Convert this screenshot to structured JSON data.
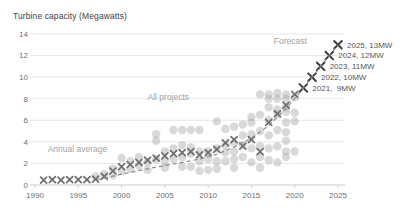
{
  "chart_data": {
    "type": "scatter",
    "title": "Turbine capacity (Megawatts)",
    "xlabel": "",
    "ylabel": "Turbine capacity (Megawatts)",
    "xlim": [
      1990,
      2026
    ],
    "ylim": [
      0,
      14
    ],
    "x_ticks": [
      1990,
      1995,
      2000,
      2005,
      2010,
      2015,
      2020,
      2025
    ],
    "y_ticks": [
      0,
      2,
      4,
      6,
      8,
      10,
      12,
      14
    ],
    "grid": "horizontal",
    "legend_position": "inline-labels",
    "series": [
      {
        "name": "All projects",
        "type": "circles",
        "points": [
          [
            1997,
            0.8
          ],
          [
            1998,
            1.0
          ],
          [
            1999,
            1.5
          ],
          [
            1999,
            0.9
          ],
          [
            2000,
            2.5
          ],
          [
            2000,
            1.3
          ],
          [
            2001,
            2.2
          ],
          [
            2001,
            1.5
          ],
          [
            2002,
            2.6
          ],
          [
            2002,
            1.8
          ],
          [
            2003,
            2.1
          ],
          [
            2003,
            1.4
          ],
          [
            2004,
            4.7
          ],
          [
            2004,
            4.1
          ],
          [
            2004,
            2.4
          ],
          [
            2005,
            3.1
          ],
          [
            2005,
            2.2
          ],
          [
            2005,
            1.6
          ],
          [
            2006,
            5.1
          ],
          [
            2006,
            3.4
          ],
          [
            2006,
            2.4
          ],
          [
            2007,
            5.1
          ],
          [
            2007,
            3.7
          ],
          [
            2007,
            2.6
          ],
          [
            2007,
            1.7
          ],
          [
            2008,
            5.1
          ],
          [
            2008,
            3.5
          ],
          [
            2008,
            2.9
          ],
          [
            2008,
            1.7
          ],
          [
            2009,
            5.1
          ],
          [
            2009,
            3.1
          ],
          [
            2009,
            2.2
          ],
          [
            2009,
            1.3
          ],
          [
            2010,
            3.1
          ],
          [
            2010,
            2.4
          ],
          [
            2010,
            1.4
          ],
          [
            2011,
            5.9
          ],
          [
            2011,
            3.4
          ],
          [
            2011,
            2.2
          ],
          [
            2011,
            1.5
          ],
          [
            2012,
            5.2
          ],
          [
            2012,
            3.7
          ],
          [
            2012,
            3.0
          ],
          [
            2012,
            2.2
          ],
          [
            2013,
            5.4
          ],
          [
            2013,
            3.9
          ],
          [
            2013,
            3.1
          ],
          [
            2013,
            2.4
          ],
          [
            2013,
            1.6
          ],
          [
            2014,
            5.6
          ],
          [
            2014,
            4.6
          ],
          [
            2014,
            3.7
          ],
          [
            2014,
            2.6
          ],
          [
            2015,
            6.3
          ],
          [
            2015,
            5.8
          ],
          [
            2015,
            4.7
          ],
          [
            2015,
            3.4
          ],
          [
            2015,
            2.1
          ],
          [
            2016,
            8.4
          ],
          [
            2016,
            6.5
          ],
          [
            2016,
            5.0
          ],
          [
            2016,
            3.6
          ],
          [
            2016,
            2.6
          ],
          [
            2016,
            1.6
          ],
          [
            2017,
            8.4
          ],
          [
            2017,
            8.0
          ],
          [
            2017,
            7.2
          ],
          [
            2017,
            6.0
          ],
          [
            2017,
            4.6
          ],
          [
            2017,
            3.4
          ],
          [
            2017,
            2.3
          ],
          [
            2018,
            8.5
          ],
          [
            2018,
            8.0
          ],
          [
            2018,
            7.0
          ],
          [
            2018,
            6.6
          ],
          [
            2018,
            5.1
          ],
          [
            2018,
            3.6
          ],
          [
            2018,
            2.1
          ],
          [
            2019,
            8.4
          ],
          [
            2019,
            8.0
          ],
          [
            2019,
            7.2
          ],
          [
            2019,
            6.8
          ],
          [
            2019,
            5.8
          ],
          [
            2019,
            4.9
          ],
          [
            2019,
            4.1
          ],
          [
            2019,
            3.1
          ],
          [
            2019,
            2.6
          ],
          [
            2020,
            8.1
          ],
          [
            2020,
            6.7
          ],
          [
            2020,
            5.9
          ],
          [
            2020,
            3.1
          ]
        ]
      },
      {
        "name": "Annual average",
        "type": "x-markers",
        "points": [
          [
            1991,
            0.45
          ],
          [
            1992,
            0.5
          ],
          [
            1993,
            0.45
          ],
          [
            1994,
            0.5
          ],
          [
            1995,
            0.5
          ],
          [
            1996,
            0.5
          ],
          [
            1997,
            0.55
          ],
          [
            1998,
            0.8
          ],
          [
            1999,
            1.3
          ],
          [
            2000,
            1.7
          ],
          [
            2001,
            1.9
          ],
          [
            2002,
            2.1
          ],
          [
            2003,
            2.3
          ],
          [
            2004,
            2.5
          ],
          [
            2005,
            2.7
          ],
          [
            2006,
            2.9
          ],
          [
            2007,
            3.0
          ],
          [
            2008,
            3.1
          ],
          [
            2009,
            2.8
          ],
          [
            2010,
            3.0
          ],
          [
            2011,
            3.3
          ],
          [
            2012,
            3.9
          ],
          [
            2013,
            4.2
          ],
          [
            2014,
            3.6
          ],
          [
            2015,
            4.2
          ],
          [
            2016,
            3.1
          ],
          [
            2017,
            5.8
          ],
          [
            2018,
            6.6
          ],
          [
            2019,
            7.4
          ],
          [
            2020,
            8.4
          ]
        ]
      },
      {
        "name": "Forecast",
        "type": "x-markers-labeled",
        "points": [
          [
            2021,
            9
          ],
          [
            2022,
            10
          ],
          [
            2023,
            11
          ],
          [
            2024,
            12
          ],
          [
            2025,
            13
          ]
        ],
        "point_labels": [
          "2021,  9MW",
          "2022, 10MW",
          "2023, 11MW",
          "2024, 12MW",
          "2025, 13MW"
        ]
      },
      {
        "name": "Trend",
        "type": "dashed-line",
        "points": [
          [
            1997.2,
            0.5
          ],
          [
            2000,
            1.0
          ],
          [
            2003,
            1.5
          ],
          [
            2006,
            1.95
          ],
          [
            2009,
            2.4
          ],
          [
            2011,
            2.85
          ],
          [
            2013,
            3.5
          ],
          [
            2015,
            4.35
          ],
          [
            2017,
            5.5
          ],
          [
            2019,
            7.1
          ],
          [
            2020,
            8.0
          ],
          [
            2021,
            9
          ],
          [
            2022,
            10
          ],
          [
            2023,
            11
          ],
          [
            2024,
            12
          ],
          [
            2025,
            13
          ]
        ]
      }
    ],
    "inline_labels": [
      {
        "id": "all-projects-label",
        "text": "All projects",
        "year": 2005.4,
        "value": 8.2,
        "anchor": "middle"
      },
      {
        "id": "annual-average-label",
        "text": "Annual average",
        "year": 1994.9,
        "value": 3.3,
        "anchor": "middle"
      },
      {
        "id": "forecast-label",
        "text": "Forecast",
        "year": 2019.5,
        "value": 13.35,
        "anchor": "middle"
      }
    ]
  },
  "colors": {
    "background": "#ffffff",
    "title_text": "#3f3f3f",
    "axis_tick_text": "#6e6e6e",
    "gridline": "#e7e7e7",
    "axis_line": "#cccccc",
    "all_projects_circle": "#ababab",
    "annual_average_x": "#6f6f6f",
    "forecast_x": "#3d3d3d",
    "trend_dash": "#8c8c8c",
    "inline_label_text": "#a3a3a3",
    "annotation_text": "#565656"
  }
}
